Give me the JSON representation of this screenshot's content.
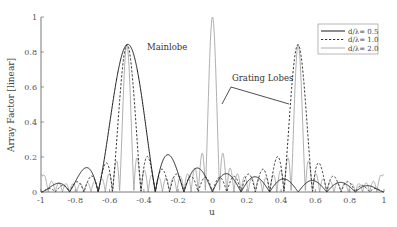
{
  "chart_data": {
    "type": "line",
    "title": "",
    "xlabel": "u",
    "ylabel": "Array Factor [linear]",
    "xlim": [
      -1,
      1
    ],
    "ylim": [
      0,
      1
    ],
    "grid": false,
    "legend_position": "upper right",
    "x_ticks": [
      "-1",
      "-0.8",
      "-0.6",
      "-0.4",
      "-0.2",
      "0",
      "0.2",
      "0.4",
      "0.6",
      "0.8",
      "1"
    ],
    "x_tick_values": [
      -1,
      -0.8,
      -0.6,
      -0.4,
      -0.2,
      0,
      0.2,
      0.4,
      0.6,
      0.8,
      1
    ],
    "y_ticks": [
      "0",
      "0.2",
      "0.4",
      "0.6",
      "0.8",
      "1"
    ],
    "y_tick_values": [
      0,
      0.2,
      0.4,
      0.6,
      0.8,
      1
    ],
    "annotations": [
      {
        "text": "Mainlobe",
        "x": -0.36,
        "y": 0.8
      },
      {
        "text": "Grating Lobes",
        "x": 0.12,
        "y": 0.65
      }
    ],
    "series": [
      {
        "name": "d/λ= 0.5",
        "style": "solid",
        "color": "#1a1a1a",
        "model": {
          "elements": 12,
          "spacing": 0.5,
          "steer_u": -0.5,
          "envelope_exp": 0.6
        },
        "key_points": [
          {
            "u": -0.5,
            "value": 0.84
          },
          {
            "u": -0.78,
            "value": 0.13
          },
          {
            "u": -0.24,
            "value": 0.17
          },
          {
            "u": -0.07,
            "value": 0.1
          },
          {
            "u": 0.15,
            "value": 0.09
          },
          {
            "u": 0.5,
            "value": 0.06
          },
          {
            "u": 0.85,
            "value": 0.05
          }
        ]
      },
      {
        "name": "d/λ= 1.0",
        "style": "dashed",
        "color": "#1a1a1a",
        "model": {
          "elements": 12,
          "spacing": 1.0,
          "steer_u": -0.5,
          "envelope_exp": 0.6
        },
        "key_points": [
          {
            "u": -0.5,
            "value": 0.83
          },
          {
            "u": 0.5,
            "value": 0.83
          },
          {
            "u": -0.62,
            "value": 0.16
          },
          {
            "u": 0.38,
            "value": 0.17
          },
          {
            "u": 0.62,
            "value": 0.17
          }
        ]
      },
      {
        "name": "d/λ= 2.0",
        "style": "solid-thin",
        "color": "#9a9a9a",
        "model": {
          "elements": 12,
          "spacing": 2.0,
          "steer_u": -0.5,
          "envelope_exp": 0.6
        },
        "key_points": [
          {
            "u": -1.0,
            "value": 0.1
          },
          {
            "u": -0.5,
            "value": 0.83
          },
          {
            "u": 0.0,
            "value": 1.0
          },
          {
            "u": 0.5,
            "value": 0.83
          },
          {
            "u": 1.0,
            "value": 0.1
          }
        ]
      }
    ]
  },
  "legend": {
    "items": [
      {
        "label": "d/λ= 0.5"
      },
      {
        "label": "d/λ= 1.0"
      },
      {
        "label": "d/λ= 2.0"
      }
    ]
  },
  "axes": {
    "xlabel": "u",
    "ylabel": "Array Factor [linear]"
  },
  "annotations": {
    "mainlobe": "Mainlobe",
    "grating": "Grating Lobes"
  }
}
